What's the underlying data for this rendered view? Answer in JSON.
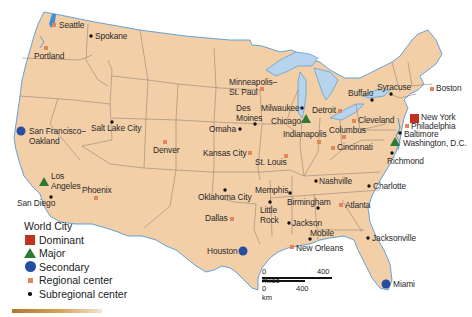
{
  "map": {
    "title": "World City hierarchy of the contiguous United States",
    "colors": {
      "land": "#f3cfa8",
      "borders": "#8a7d72",
      "water": "#b8d4ec",
      "coast": "#3d8fd6",
      "dominant": "#c0311e",
      "major": "#2e7a34",
      "secondary": "#264ea0",
      "regional": "#e0865a",
      "subregional": "#111111"
    },
    "cities": [
      {
        "name": "New York",
        "type": "dominant"
      },
      {
        "name": "Los Angeles",
        "type": "major"
      },
      {
        "name": "Chicago",
        "type": "major"
      },
      {
        "name": "Washington, D.C.",
        "type": "major"
      },
      {
        "name": "San Francisco–Oakland",
        "type": "secondary"
      },
      {
        "name": "Houston",
        "type": "secondary"
      },
      {
        "name": "Miami",
        "type": "secondary"
      },
      {
        "name": "Seattle",
        "type": "regional"
      },
      {
        "name": "Portland",
        "type": "regional"
      },
      {
        "name": "Phoenix",
        "type": "regional"
      },
      {
        "name": "Denver",
        "type": "regional"
      },
      {
        "name": "Minneapolis–St. Paul",
        "type": "regional"
      },
      {
        "name": "Kansas City",
        "type": "regional"
      },
      {
        "name": "St. Louis",
        "type": "regional"
      },
      {
        "name": "Dallas",
        "type": "regional"
      },
      {
        "name": "New Orleans",
        "type": "regional"
      },
      {
        "name": "Detroit",
        "type": "regional"
      },
      {
        "name": "Indianapolis",
        "type": "regional"
      },
      {
        "name": "Columbus",
        "type": "regional"
      },
      {
        "name": "Cincinnati",
        "type": "regional"
      },
      {
        "name": "Cleveland",
        "type": "regional"
      },
      {
        "name": "Atlanta",
        "type": "regional"
      },
      {
        "name": "Philadelphia",
        "type": "regional"
      },
      {
        "name": "Boston",
        "type": "regional"
      },
      {
        "name": "Spokane",
        "type": "subregional"
      },
      {
        "name": "Salt Lake City",
        "type": "subregional"
      },
      {
        "name": "San Diego",
        "type": "subregional"
      },
      {
        "name": "Omaha",
        "type": "subregional"
      },
      {
        "name": "Des Moines",
        "type": "subregional"
      },
      {
        "name": "Milwaukee",
        "type": "subregional"
      },
      {
        "name": "Oklahoma City",
        "type": "subregional"
      },
      {
        "name": "Little Rock",
        "type": "subregional"
      },
      {
        "name": "Memphis",
        "type": "subregional"
      },
      {
        "name": "Birmingham",
        "type": "subregional"
      },
      {
        "name": "Jackson",
        "type": "subregional"
      },
      {
        "name": "Mobile",
        "type": "subregional"
      },
      {
        "name": "Nashville",
        "type": "subregional"
      },
      {
        "name": "Charlotte",
        "type": "subregional"
      },
      {
        "name": "Jacksonville",
        "type": "subregional"
      },
      {
        "name": "Richmond",
        "type": "subregional"
      },
      {
        "name": "Baltimore",
        "type": "subregional"
      },
      {
        "name": "Buffalo",
        "type": "subregional"
      },
      {
        "name": "Syracuse",
        "type": "subregional"
      }
    ]
  },
  "labels": {
    "seattle": "Seattle",
    "spokane": "Spokane",
    "portland": "Portland",
    "sf1": "San Francisco–",
    "sf2": "Oakland",
    "slc": "Salt Lake City",
    "la1": "Los",
    "la2": "Angeles",
    "sandiego": "San Diego",
    "phoenix": "Phoenix",
    "denver": "Denver",
    "msp1": "Minneapolis–",
    "msp2": "St. Paul",
    "desmoines1": "Des",
    "desmoines2": "Moines",
    "omaha": "Omaha",
    "milwaukee": "Milwaukee",
    "chicago": "Chicago",
    "kc": "Kansas City",
    "stl": "St. Louis",
    "okc": "Oklahoma City",
    "dallas": "Dallas",
    "memphis": "Memphis",
    "littlerock1": "Little",
    "littlerock2": "Rock",
    "birmingham": "Birmingham",
    "jackson": "Jackson",
    "mobile": "Mobile",
    "neworleans": "New Orleans",
    "houston": "Houston",
    "miami": "Miami",
    "jacksonville": "Jacksonville",
    "atlanta": "Atlanta",
    "charlotte": "Charlotte",
    "nashville": "Nashville",
    "indianapolis": "Indianapolis",
    "detroit": "Detroit",
    "columbus": "Columbus",
    "cincinnati": "Cincinnati",
    "cleveland": "Cleveland",
    "buffalo": "Buffalo",
    "syracuse": "Syracuse",
    "boston": "Boston",
    "newyork": "New York",
    "philadelphia": "Philadelphia",
    "baltimore": "Baltimore",
    "washington": "Washington, D.C.",
    "richmond": "Richmond"
  },
  "legend": {
    "title": "World City",
    "items": [
      {
        "label": "Dominant",
        "symbol": "red-square"
      },
      {
        "label": "Major",
        "symbol": "green-triangle"
      },
      {
        "label": "Secondary",
        "symbol": "blue-circle"
      },
      {
        "label": "Regional center",
        "symbol": "orange-square"
      },
      {
        "label": "Subregional center",
        "symbol": "black-dot"
      }
    ]
  },
  "scale": {
    "miles_label": "0 miles",
    "miles_value": "400",
    "km_label": "0 km",
    "km_value": "400"
  }
}
